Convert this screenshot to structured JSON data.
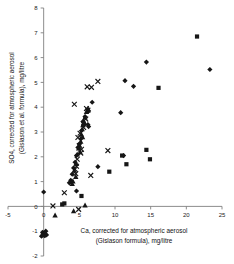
{
  "chart_data": {
    "type": "scatter",
    "title": "",
    "xlabel": "Ca, corrected for atmospheric aerosol (Gislason formula), mg/litre",
    "xlabel_line1": "Ca, corrected for atmospheric aerosol",
    "xlabel_line2": "(Gislason formula), mg/litre",
    "ylabel": "SO4, corrected for atmospheric aerosol (Gislason et al. formula), mg/litre",
    "ylabel_line1": "SO4, corrected for atmospheric aerosol",
    "ylabel_line2": "(Gislason et al. formula), mg/litre",
    "xlim": [
      -5,
      25
    ],
    "ylim": [
      -2,
      8
    ],
    "xticks": [
      -5,
      0,
      5,
      10,
      15,
      20,
      25
    ],
    "yticks": [
      -2,
      -1,
      0,
      1,
      2,
      3,
      4,
      5,
      6,
      7,
      8
    ],
    "xtick_labels": [
      "-5",
      "0",
      "5",
      "10",
      "15",
      "20",
      "25"
    ],
    "ytick_labels": [
      "-2",
      "-1",
      "0",
      "1",
      "2",
      "3",
      "4",
      "5",
      "6",
      "7",
      "8"
    ],
    "grid": false,
    "legend": "none",
    "axis_color": "#808080",
    "marker_color": "#161616",
    "series": [
      {
        "name": "diamond-series",
        "marker": "diamond",
        "points": [
          [
            0.0,
            0.58
          ],
          [
            4.6,
            0.62
          ],
          [
            5.5,
            3.42
          ],
          [
            6.3,
            3.22
          ],
          [
            6.2,
            3.3
          ],
          [
            6.8,
            4.2
          ],
          [
            6.3,
            3.85
          ],
          [
            5.8,
            3.62
          ],
          [
            5.6,
            3.3
          ],
          [
            5.3,
            3.05
          ],
          [
            5.2,
            2.72
          ],
          [
            5.0,
            2.52
          ],
          [
            4.8,
            2.38
          ],
          [
            4.6,
            2.05
          ],
          [
            4.4,
            1.78
          ],
          [
            4.2,
            1.55
          ],
          [
            4.0,
            1.3
          ],
          [
            3.8,
            1.05
          ],
          [
            3.6,
            0.95
          ],
          [
            7.6,
            1.6
          ],
          [
            10.8,
            3.78
          ],
          [
            11.4,
            5.07
          ],
          [
            12.6,
            4.84
          ],
          [
            14.4,
            5.82
          ],
          [
            11.2,
            2.05
          ],
          [
            23.3,
            5.52
          ],
          [
            -0.15,
            -1.05
          ],
          [
            -0.1,
            -1.12
          ],
          [
            0.05,
            -1.08
          ],
          [
            0.15,
            -1.18
          ],
          [
            0.3,
            -1.0
          ],
          [
            -0.3,
            -1.2
          ],
          [
            0.4,
            -1.15
          ]
        ]
      },
      {
        "name": "square-series",
        "marker": "square",
        "points": [
          [
            2.9,
            0.12
          ],
          [
            5.3,
            0.42
          ],
          [
            9.2,
            1.4
          ],
          [
            11.6,
            1.7
          ],
          [
            11.0,
            2.05
          ],
          [
            14.9,
            1.9
          ],
          [
            16.1,
            4.78
          ],
          [
            21.5,
            6.85
          ],
          [
            14.4,
            2.28
          ],
          [
            2.6,
            0.08
          ]
        ]
      },
      {
        "name": "triangle-series",
        "marker": "triangle",
        "points": [
          [
            1.6,
            -0.35
          ],
          [
            4.2,
            -0.18
          ],
          [
            5.8,
            0.05
          ],
          [
            4.5,
            1.2
          ],
          [
            4.3,
            1.45
          ],
          [
            4.6,
            1.72
          ],
          [
            4.7,
            2.1
          ],
          [
            4.9,
            2.35
          ],
          [
            5.0,
            2.48
          ],
          [
            5.2,
            2.62
          ],
          [
            5.3,
            2.9
          ],
          [
            5.4,
            3.12
          ],
          [
            5.5,
            3.28
          ],
          [
            5.6,
            3.45
          ],
          [
            5.8,
            3.6
          ],
          [
            6.0,
            3.82
          ],
          [
            6.2,
            3.95
          ],
          [
            4.1,
            1.02
          ],
          [
            4.0,
            0.92
          ],
          [
            5.1,
            2.2
          ],
          [
            5.45,
            2.8
          ],
          [
            5.7,
            3.38
          ],
          [
            0.1,
            -1.1
          ],
          [
            0.2,
            -1.05
          ],
          [
            -0.05,
            -1.15
          ]
        ]
      },
      {
        "name": "cross-series",
        "marker": "x",
        "points": [
          [
            1.3,
            0.02
          ],
          [
            2.9,
            0.55
          ],
          [
            4.9,
            -0.12
          ],
          [
            4.3,
            4.12
          ],
          [
            6.1,
            4.82
          ],
          [
            6.7,
            4.8
          ],
          [
            7.6,
            5.04
          ],
          [
            6.0,
            3.95
          ],
          [
            6.2,
            3.88
          ],
          [
            6.6,
            1.25
          ],
          [
            9.0,
            2.25
          ],
          [
            4.5,
            1.32
          ],
          [
            4.6,
            1.62
          ],
          [
            4.4,
            1.5
          ],
          [
            5.0,
            2.45
          ],
          [
            5.2,
            2.15
          ],
          [
            4.8,
            2.78
          ],
          [
            5.6,
            3.18
          ],
          [
            5.9,
            3.52
          ],
          [
            5.3,
            2.3
          ],
          [
            4.7,
            1.9
          ],
          [
            5.1,
            2.95
          ]
        ]
      }
    ]
  }
}
